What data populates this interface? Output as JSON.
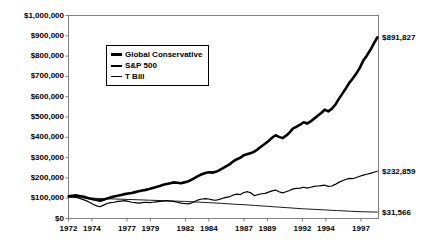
{
  "chart_data": {
    "type": "line",
    "title": "",
    "xlabel": "",
    "ylabel": "",
    "xlim": [
      1972,
      1998.5
    ],
    "ylim": [
      0,
      1000000
    ],
    "grid": false,
    "legend_position": "upper-left-inside",
    "y_ticks": [
      "$0",
      "$100,000",
      "$200,000",
      "$300,000",
      "$400,000",
      "$500,000",
      "$600,000",
      "$700,000",
      "$800,000",
      "$900,000",
      "$1,000,000"
    ],
    "y_tick_values": [
      0,
      100000,
      200000,
      300000,
      400000,
      500000,
      600000,
      700000,
      800000,
      900000,
      1000000
    ],
    "x_ticks": [
      "1972",
      "1974",
      "1977",
      "1979",
      "1982",
      "1984",
      "1987",
      "1989",
      "1992",
      "1994",
      "1997"
    ],
    "x_tick_values": [
      1972,
      1974,
      1977,
      1979,
      1982,
      1984,
      1987,
      1989,
      1992,
      1994,
      1997
    ],
    "end_labels": [
      {
        "series": "Global Conservative",
        "text": "$891,827",
        "value": 891827
      },
      {
        "series": "S&P 500",
        "text": "$232,859",
        "value": 232859
      },
      {
        "series": "T Bill",
        "text": "$31,566",
        "value": 31566
      }
    ],
    "series": [
      {
        "name": "Global Conservative",
        "style": "thick",
        "x": [
          1972.0,
          1972.3,
          1972.6,
          1972.9,
          1973.2,
          1973.5,
          1973.8,
          1974.1,
          1974.4,
          1974.7,
          1975.0,
          1975.3,
          1975.6,
          1975.9,
          1976.2,
          1976.5,
          1976.8,
          1977.1,
          1977.4,
          1977.7,
          1978.0,
          1978.3,
          1978.6,
          1978.9,
          1979.2,
          1979.5,
          1979.8,
          1980.1,
          1980.4,
          1980.7,
          1981.0,
          1981.3,
          1981.6,
          1981.9,
          1982.2,
          1982.5,
          1982.8,
          1983.1,
          1983.4,
          1983.7,
          1984.0,
          1984.3,
          1984.6,
          1984.9,
          1985.2,
          1985.5,
          1985.8,
          1986.1,
          1986.4,
          1986.7,
          1987.0,
          1987.3,
          1987.6,
          1987.9,
          1988.2,
          1988.5,
          1988.8,
          1989.1,
          1989.4,
          1989.7,
          1990.0,
          1990.3,
          1990.6,
          1990.9,
          1991.2,
          1991.5,
          1991.8,
          1992.1,
          1992.4,
          1992.7,
          1993.0,
          1993.3,
          1993.6,
          1993.9,
          1994.2,
          1994.5,
          1994.8,
          1995.1,
          1995.4,
          1995.7,
          1996.0,
          1996.3,
          1996.6,
          1996.9,
          1997.2,
          1997.5,
          1997.8,
          1998.1,
          1998.4
        ],
        "y": [
          110000,
          112000,
          114000,
          111000,
          108000,
          104000,
          99000,
          95000,
          91000,
          88000,
          92000,
          99000,
          104000,
          108000,
          112000,
          116000,
          120000,
          123000,
          126000,
          130000,
          134000,
          138000,
          141000,
          145000,
          150000,
          155000,
          160000,
          166000,
          170000,
          174000,
          178000,
          176000,
          174000,
          178000,
          182000,
          190000,
          200000,
          210000,
          218000,
          224000,
          228000,
          226000,
          230000,
          238000,
          248000,
          258000,
          268000,
          282000,
          292000,
          300000,
          312000,
          318000,
          322000,
          330000,
          342000,
          356000,
          368000,
          382000,
          398000,
          410000,
          402000,
          396000,
          408000,
          424000,
          444000,
          452000,
          462000,
          474000,
          468000,
          478000,
          492000,
          506000,
          520000,
          536000,
          528000,
          540000,
          560000,
          588000,
          614000,
          640000,
          668000,
          690000,
          714000,
          742000,
          778000,
          802000,
          830000,
          862000,
          891827
        ]
      },
      {
        "name": "S&P 500",
        "style": "medium",
        "x": [
          1972.0,
          1972.3,
          1972.6,
          1972.9,
          1973.2,
          1973.5,
          1973.8,
          1974.1,
          1974.4,
          1974.7,
          1975.0,
          1975.3,
          1975.6,
          1975.9,
          1976.2,
          1976.5,
          1976.8,
          1977.1,
          1977.4,
          1977.7,
          1978.0,
          1978.3,
          1978.6,
          1978.9,
          1979.2,
          1979.5,
          1979.8,
          1980.1,
          1980.4,
          1980.7,
          1981.0,
          1981.3,
          1981.6,
          1981.9,
          1982.2,
          1982.5,
          1982.8,
          1983.1,
          1983.4,
          1983.7,
          1984.0,
          1984.3,
          1984.6,
          1984.9,
          1985.2,
          1985.5,
          1985.8,
          1986.1,
          1986.4,
          1986.7,
          1987.0,
          1987.3,
          1987.6,
          1987.9,
          1988.2,
          1988.5,
          1988.8,
          1989.1,
          1989.4,
          1989.7,
          1990.0,
          1990.3,
          1990.6,
          1990.9,
          1991.2,
          1991.5,
          1991.8,
          1992.1,
          1992.4,
          1992.7,
          1993.0,
          1993.3,
          1993.6,
          1993.9,
          1994.2,
          1994.5,
          1994.8,
          1995.1,
          1995.4,
          1995.7,
          1996.0,
          1996.3,
          1996.6,
          1996.9,
          1997.2,
          1997.5,
          1997.8,
          1998.1,
          1998.4
        ],
        "y": [
          108000,
          110000,
          106000,
          100000,
          94000,
          88000,
          80000,
          70000,
          62000,
          58000,
          66000,
          74000,
          78000,
          80000,
          84000,
          86000,
          88000,
          84000,
          80000,
          78000,
          76000,
          78000,
          80000,
          78000,
          80000,
          82000,
          84000,
          86000,
          88000,
          86000,
          84000,
          80000,
          76000,
          74000,
          72000,
          76000,
          84000,
          92000,
          96000,
          98000,
          96000,
          92000,
          90000,
          94000,
          100000,
          104000,
          108000,
          116000,
          120000,
          118000,
          128000,
          132000,
          126000,
          112000,
          118000,
          122000,
          124000,
          130000,
          136000,
          140000,
          132000,
          126000,
          132000,
          138000,
          146000,
          148000,
          150000,
          154000,
          150000,
          154000,
          158000,
          160000,
          162000,
          164000,
          158000,
          160000,
          168000,
          178000,
          186000,
          192000,
          198000,
          196000,
          202000,
          208000,
          214000,
          218000,
          222000,
          228000,
          232859
        ]
      },
      {
        "name": "T Bill",
        "style": "thin",
        "x": [
          1972.0,
          1973.0,
          1974.0,
          1975.0,
          1976.0,
          1977.0,
          1978.0,
          1979.0,
          1980.0,
          1981.0,
          1982.0,
          1983.0,
          1984.0,
          1985.0,
          1986.0,
          1987.0,
          1988.0,
          1989.0,
          1990.0,
          1991.0,
          1992.0,
          1993.0,
          1994.0,
          1995.0,
          1996.0,
          1997.0,
          1998.4
        ],
        "y": [
          104000,
          102000,
          100000,
          98000,
          96000,
          94000,
          92000,
          90000,
          88000,
          86000,
          84000,
          81000,
          78000,
          75000,
          71000,
          68000,
          64000,
          60000,
          56000,
          52000,
          48000,
          45000,
          42000,
          39000,
          36000,
          33500,
          31566
        ]
      }
    ]
  },
  "legend": {
    "items": [
      {
        "label": "Global Conservative",
        "style": "thick"
      },
      {
        "label": "S&P 500",
        "style": "medium"
      },
      {
        "label": "T Bill",
        "style": "thin"
      }
    ]
  }
}
